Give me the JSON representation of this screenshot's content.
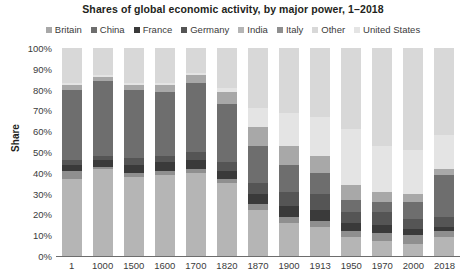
{
  "chart_data": {
    "type": "bar",
    "stacked": true,
    "stack_mode": "percent",
    "title": "Shares of global economic activity, by major power, 1–2018",
    "xlabel": "",
    "ylabel": "Share",
    "ylim": [
      0,
      100
    ],
    "yticks": [
      "0%",
      "10%",
      "20%",
      "30%",
      "40%",
      "50%",
      "60%",
      "70%",
      "80%",
      "90%",
      "100%"
    ],
    "ytick_values": [
      0,
      10,
      20,
      30,
      40,
      50,
      60,
      70,
      80,
      90,
      100
    ],
    "grid": false,
    "legend_position": "top",
    "legend": [
      "Britain",
      "China",
      "France",
      "Germany",
      "India",
      "Italy",
      "Other",
      "United States"
    ],
    "categories": [
      "1",
      "1000",
      "1500",
      "1600",
      "1700",
      "1820",
      "1870",
      "1900",
      "1913",
      "1950",
      "1970",
      "2000",
      "2018"
    ],
    "stack_order_bottom_to_top": [
      "India",
      "Italy",
      "France",
      "Germany",
      "China",
      "Britain",
      "United States",
      "Other"
    ],
    "colors": {
      "Britain": "#a8a8a8",
      "China": "#6e6e6e",
      "France": "#3a3a3a",
      "Germany": "#555555",
      "India": "#b5b5b5",
      "Italy": "#8f8f8f",
      "Other": "#d8d8d8",
      "United States": "#e4e4e4"
    },
    "series": [
      {
        "name": "India",
        "values": [
          37,
          42,
          38,
          39,
          40,
          35,
          22,
          16,
          14,
          9,
          7,
          6,
          9
        ]
      },
      {
        "name": "Italy",
        "values": [
          4,
          1,
          2,
          2,
          2,
          2,
          3,
          3,
          3,
          3,
          4,
          4,
          3
        ]
      },
      {
        "name": "France",
        "values": [
          3,
          3,
          4,
          4,
          4,
          4,
          5,
          5,
          5,
          4,
          4,
          3,
          2
        ]
      },
      {
        "name": "Germany",
        "values": [
          2,
          2,
          3,
          3,
          4,
          4,
          5,
          7,
          8,
          5,
          6,
          5,
          5
        ]
      },
      {
        "name": "China",
        "values": [
          34,
          36,
          33,
          31,
          33,
          28,
          18,
          13,
          10,
          6,
          5,
          8,
          20
        ]
      },
      {
        "name": "Britain",
        "values": [
          2,
          2,
          2,
          3,
          4,
          6,
          9,
          9,
          8,
          7,
          5,
          4,
          3
        ]
      },
      {
        "name": "United States",
        "values": [
          1,
          1,
          1,
          1,
          1,
          2,
          9,
          16,
          19,
          27,
          22,
          21,
          16
        ]
      },
      {
        "name": "Other",
        "values": [
          17,
          13,
          17,
          17,
          12,
          19,
          29,
          31,
          33,
          39,
          47,
          49,
          42
        ]
      }
    ]
  }
}
